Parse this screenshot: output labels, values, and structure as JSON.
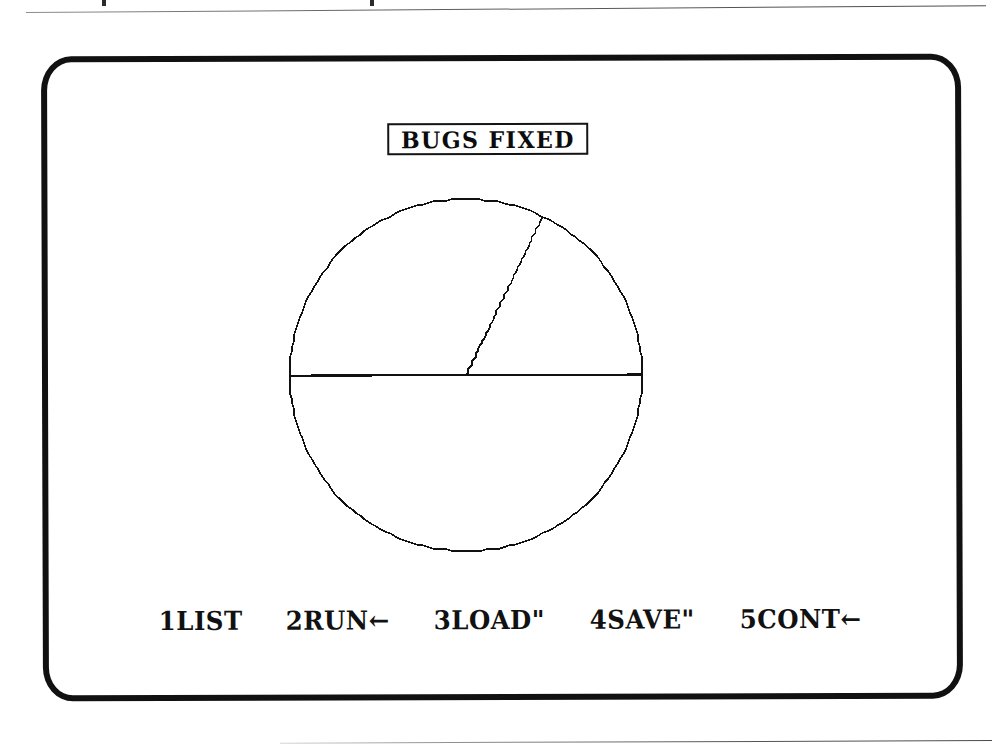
{
  "page": {
    "background_color": "#ffffff",
    "rule_color": "#5a5a5e",
    "caption_above_cropped": ""
  },
  "screen": {
    "device": "ZX Spectrum television display",
    "bezel_color": "#111111",
    "ink_color": "#111111",
    "paper_color": "#ffffff",
    "title": "BUGS FIXED"
  },
  "menu": {
    "items": [
      {
        "key": "1",
        "label": "1LIST",
        "name": "list"
      },
      {
        "key": "2",
        "label": "2RUN←",
        "name": "run"
      },
      {
        "key": "3",
        "label": "3LOAD\"",
        "name": "load"
      },
      {
        "key": "4",
        "label": "4SAVE\"",
        "name": "save"
      },
      {
        "key": "5",
        "label": "5CONT←",
        "name": "cont"
      }
    ]
  },
  "chart_data": {
    "type": "pie",
    "title": "BUGS FIXED",
    "subtitle": "",
    "xlabel": "",
    "ylabel": "",
    "legend": [],
    "legend_position": "none",
    "grid": false,
    "center_x": 504,
    "center_y": 373,
    "radius": 180,
    "start_angle_deg": 180,
    "direction": "counterclockwise",
    "stroke_color": "#111111",
    "fill_color": "#ffffff",
    "slice_boundaries_deg": [
      0,
      64,
      180
    ],
    "categories": [
      "Slice 1",
      "Slice 2",
      "Slice 3"
    ],
    "values": [
      17.8,
      32.2,
      50.0
    ],
    "value_unit": "percent",
    "labels_shown": false
  }
}
